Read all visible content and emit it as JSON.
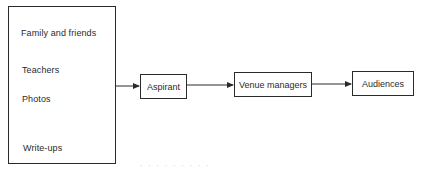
{
  "diagram": {
    "sources": {
      "items": [
        "Family and friends",
        "Teachers",
        "Photos",
        "Write-ups"
      ]
    },
    "nodes": [
      {
        "id": "aspirant",
        "label": "Aspirant"
      },
      {
        "id": "venue-managers",
        "label": "Venue managers"
      },
      {
        "id": "audiences",
        "label": "Audiences"
      }
    ],
    "edges": [
      {
        "from": "sources",
        "to": "aspirant"
      },
      {
        "from": "aspirant",
        "to": "venue-managers"
      },
      {
        "from": "venue-managers",
        "to": "audiences"
      }
    ],
    "caption": "· ·   ·  ·    ·  ·   ·  · ·"
  }
}
